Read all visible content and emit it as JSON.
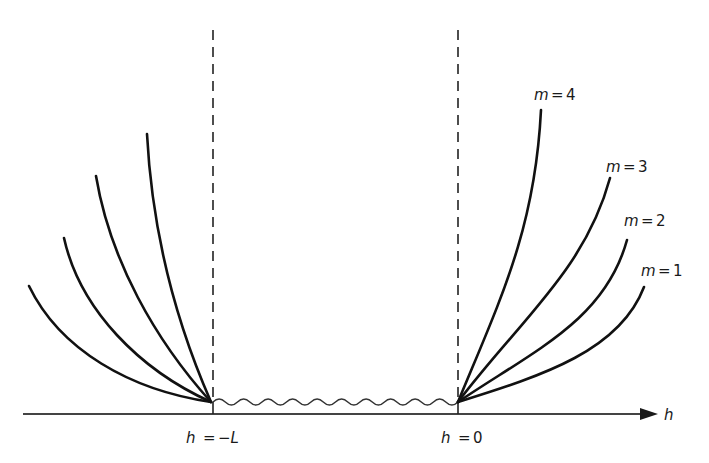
{
  "diagram": {
    "axis": {
      "label": "h",
      "color": "#1a1a1a"
    },
    "markers": [
      {
        "label_var": "h",
        "label_eq": "=",
        "label_val": "−L",
        "x": 213
      },
      {
        "label_var": "h",
        "label_eq": "=",
        "label_val": "0",
        "x": 458
      }
    ],
    "right_curves": [
      {
        "m_var": "m",
        "m_eq": "=",
        "m_val": "4"
      },
      {
        "m_var": "m",
        "m_eq": "=",
        "m_val": "3"
      },
      {
        "m_var": "m",
        "m_eq": "=",
        "m_val": "2"
      },
      {
        "m_var": "m",
        "m_eq": "=",
        "m_val": "1"
      }
    ],
    "left_curves_count": 4,
    "wavy_region": "interface between h = −L and h = 0"
  }
}
